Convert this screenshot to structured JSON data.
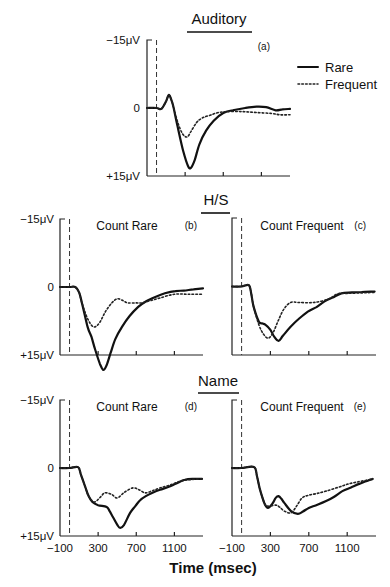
{
  "chart_data": {
    "type": "line",
    "xlabel": "Time (msec)",
    "legend": {
      "placement": "right of panel (a)",
      "entries": [
        {
          "name": "Rare",
          "style": "solid"
        },
        {
          "name": "Frequent",
          "style": "dotted"
        }
      ]
    },
    "group_titles": {
      "auditory": "Auditory",
      "hs": "H/S",
      "name": "Name"
    },
    "y_tick_labels": {
      "top": "−15μV",
      "zero": "0",
      "bottom": "+15μV"
    },
    "x_tick_labels": [
      "−100",
      "300",
      "700",
      "1100"
    ],
    "x_ticks": [
      300,
      700,
      1100
    ],
    "xlim": [
      -100,
      1400
    ],
    "ylim": [
      -15,
      15
    ],
    "y_inverted": true,
    "stimulus_onset_ms": 0,
    "panels": [
      {
        "id": "a",
        "label": "(a)",
        "subtitle": "",
        "series": [
          {
            "name": "Rare",
            "x": [
              -100,
              0,
              50,
              100,
              130,
              160,
              180,
              220,
              280,
              330,
              360,
              400,
              450,
              520,
              600,
              700,
              800,
              930,
              1050,
              1150,
              1250,
              1320,
              1400
            ],
            "y": [
              0,
              0,
              0.2,
              -1.5,
              -2.9,
              -1.5,
              0,
              4.0,
              9.5,
              12.8,
              13.2,
              11.5,
              8.0,
              5.0,
              2.8,
              1.1,
              0.5,
              0,
              -0.3,
              -0.2,
              0.5,
              0.3,
              0.2
            ]
          },
          {
            "name": "Frequent",
            "x": [
              -100,
              0,
              50,
              100,
              130,
              160,
              180,
              220,
              270,
              320,
              360,
              420,
              480,
              560,
              650,
              750,
              900,
              1050,
              1200,
              1300,
              1400
            ],
            "y": [
              0,
              0,
              0.2,
              -1.5,
              -2.9,
              -1.5,
              0,
              3.0,
              5.6,
              6.4,
              5.2,
              3.2,
              2.2,
              1.6,
              1.0,
              0.8,
              0.8,
              1.0,
              1.2,
              1.5,
              1.5
            ]
          }
        ]
      },
      {
        "id": "b",
        "label": "(b)",
        "subtitle": "Count Rare",
        "series": [
          {
            "name": "Rare",
            "x": [
              -100,
              0,
              60,
              100,
              130,
              190,
              230,
              270,
              320,
              355,
              390,
              430,
              480,
              550,
              630,
              720,
              800,
              900,
              1000,
              1110,
              1200,
              1300,
              1400
            ],
            "y": [
              0,
              0,
              0,
              1.2,
              3.5,
              8.8,
              11.0,
              13.9,
              17.0,
              18.3,
              17.2,
              14.6,
              11.5,
              8.8,
              6.4,
              4.4,
              3.2,
              2.2,
              1.4,
              0.9,
              0.8,
              0.5,
              0.3
            ]
          },
          {
            "name": "Frequent",
            "x": [
              -100,
              0,
              60,
              100,
              130,
              190,
              250,
              310,
              375,
              440,
              500,
              560,
              610,
              700,
              760,
              850,
              950,
              1100,
              1250,
              1400
            ],
            "y": [
              0,
              0,
              0,
              1.2,
              3.5,
              7.0,
              8.8,
              8.0,
              5.5,
              3.6,
              2.6,
              3.0,
              3.5,
              3.5,
              3.5,
              3.0,
              2.4,
              1.6,
              1.6,
              1.6
            ]
          }
        ]
      },
      {
        "id": "c",
        "label": "(c)",
        "subtitle": "Count Frequent",
        "series": [
          {
            "name": "Rare",
            "x": [
              -100,
              0,
              75,
              100,
              125,
              180,
              220,
              250,
              300,
              340,
              385,
              430,
              510,
              600,
              690,
              780,
              860,
              950,
              1040,
              1150,
              1250,
              1385
            ],
            "y": [
              0,
              0,
              -0.3,
              1.5,
              4.4,
              7.7,
              8.1,
              8.4,
              9.5,
              11.0,
              11.9,
              10.8,
              8.8,
              7.0,
              5.5,
              4.5,
              3.3,
              2.4,
              1.5,
              1.3,
              1.2,
              1.1
            ]
          },
          {
            "name": "Frequent",
            "x": [
              -100,
              0,
              75,
              100,
              125,
              180,
              230,
              280,
              330,
              385,
              440,
              510,
              600,
              750,
              900,
              1000,
              1100,
              1250,
              1385
            ],
            "y": [
              0,
              0,
              -0.3,
              1.5,
              4.4,
              8.4,
              10.5,
              11.3,
              10.0,
              7.3,
              5.0,
              3.5,
              3.5,
              3.5,
              2.8,
              1.6,
              1.5,
              1.4,
              1.3
            ]
          }
        ]
      },
      {
        "id": "d",
        "label": "(d)",
        "subtitle": "Count Rare",
        "series": [
          {
            "name": "Rare",
            "x": [
              -100,
              0,
              90,
              120,
              165,
              200,
              240,
              300,
              390,
              420,
              455,
              500,
              530,
              570,
              635,
              690,
              740,
              800,
              865,
              950,
              1035,
              1120,
              1210,
              1300,
              1390
            ],
            "y": [
              0,
              0,
              -0.2,
              1.5,
              4.2,
              6.2,
              7.5,
              8.2,
              8.6,
              9.5,
              10.8,
              12.5,
              13.2,
              12.6,
              9.9,
              8.4,
              7.1,
              6.2,
              5.5,
              4.8,
              4.2,
              3.4,
              2.6,
              2.4,
              2.4
            ]
          },
          {
            "name": "Frequent",
            "x": [
              -100,
              0,
              90,
              120,
              165,
              200,
              260,
              320,
              370,
              440,
              500,
              580,
              665,
              730,
              795,
              870,
              950,
              1050,
              1150,
              1250,
              1390
            ],
            "y": [
              0,
              0,
              -0.2,
              1.5,
              4.2,
              6.2,
              7.5,
              6.5,
              5.5,
              5.8,
              6.6,
              5.3,
              4.4,
              4.8,
              5.5,
              5.0,
              4.4,
              3.8,
              3.0,
              2.6,
              2.4
            ]
          }
        ]
      },
      {
        "id": "e",
        "label": "(e)",
        "subtitle": "Count Frequent",
        "series": [
          {
            "name": "Rare",
            "x": [
              -100,
              0,
              130,
              160,
              190,
              240,
              275,
              320,
              355,
              385,
              415,
              445,
              515,
              585,
              640,
              700,
              790,
              880,
              960,
              1050,
              1140,
              1225,
              1300,
              1365
            ],
            "y": [
              0,
              0,
              -0.2,
              1.8,
              4.6,
              7.9,
              8.8,
              7.9,
              6.6,
              6.2,
              6.8,
              7.7,
              9.5,
              10.1,
              9.6,
              8.8,
              8.1,
              7.3,
              6.4,
              5.1,
              4.3,
              3.5,
              2.9,
              2.4
            ]
          },
          {
            "name": "Frequent",
            "x": [
              -100,
              0,
              130,
              160,
              190,
              240,
              275,
              320,
              365,
              400,
              445,
              515,
              570,
              630,
              700,
              790,
              880,
              1000,
              1100,
              1200,
              1300,
              1365
            ],
            "y": [
              0,
              0,
              -0.2,
              1.8,
              4.6,
              7.9,
              8.4,
              8.3,
              8.2,
              8.7,
              9.5,
              9.9,
              8.5,
              6.6,
              6.0,
              5.6,
              5.1,
              4.3,
              3.6,
              3.1,
              2.7,
              2.4
            ]
          }
        ]
      }
    ]
  }
}
